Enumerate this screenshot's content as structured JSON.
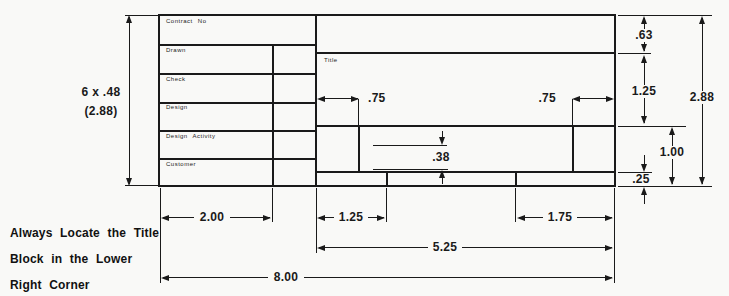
{
  "note": {
    "lines": [
      "Always Locate the Title",
      "Block in the Lower",
      "Right Corner"
    ]
  },
  "left_block": {
    "rows": [
      {
        "label": "Contract No"
      },
      {
        "label": "Drawn"
      },
      {
        "label": "Check"
      },
      {
        "label": "Design"
      },
      {
        "label": "Design Activity"
      },
      {
        "label": "Customer"
      }
    ]
  },
  "title_block": {
    "label": "Title"
  },
  "dims": {
    "height_count": "6 x .48",
    "height_total": "(2.88)",
    "strip_top": ".63",
    "title_area": "1.25",
    "overall_height": "2.88",
    "band": "1.00",
    "strip_bottom": ".25",
    "inset_left": ".75",
    "inset_right": ".75",
    "guide": ".38",
    "left_col": "2.00",
    "cell_left": "1.25",
    "cell_right": "1.75",
    "title_width": "5.25",
    "overall_width": "8.00"
  },
  "colors": {
    "ink": "#1a1a1a",
    "paper": "#f9f9f7"
  }
}
